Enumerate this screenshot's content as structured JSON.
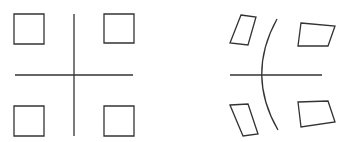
{
  "diagram": {
    "stroke_color": "#333333",
    "background": "#ffffff",
    "left_panel": {
      "label": "original",
      "squares": [
        {
          "id": "top-left",
          "points": "14,14 44,14 44,44 14,44"
        },
        {
          "id": "top-right",
          "points": "104,14 134,14 134,43 104,43"
        },
        {
          "id": "bottom-left",
          "points": "14,106 44,106 44,136 14,136"
        },
        {
          "id": "bottom-right",
          "points": "104,106 134,106 134,136 104,136"
        }
      ],
      "horizontal_axis": {
        "x1": 15,
        "y1": 75,
        "x2": 133,
        "y2": 75
      },
      "vertical_axis": {
        "x1": 74,
        "y1": 14,
        "x2": 74,
        "y2": 136
      }
    },
    "right_panel": {
      "label": "distorted",
      "quads": [
        {
          "id": "top-left",
          "points": "241,15 256,17 248,45 230,43"
        },
        {
          "id": "top-right",
          "points": "301,23 335,26 328,46 298,46"
        },
        {
          "id": "bottom-left",
          "points": "230,105 248,104 258,134 243,136"
        },
        {
          "id": "bottom-right",
          "points": "298,102 328,101 335,122 301,127"
        }
      ],
      "horizontal_axis": {
        "x1": 230,
        "y1": 75,
        "x2": 322,
        "y2": 75
      },
      "curved_axis": {
        "d": "M 277 19 Q 246 75 278 130"
      }
    }
  }
}
